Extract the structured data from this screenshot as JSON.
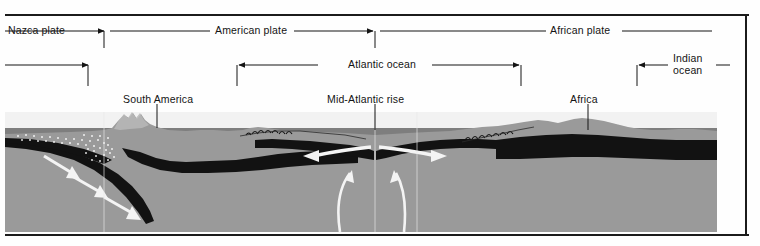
{
  "figure": {
    "colors": {
      "background": "#fefefe",
      "frame": "#1b1b1b",
      "mantle": "#7e7e7e",
      "crust_dark": "#121212",
      "landmass": "#9a9a9a",
      "water_sky": "#f2f2f2",
      "arrow_white": "#f4f4f4",
      "label_text": "#141414"
    }
  },
  "plate_labels": [
    {
      "id": "nazca",
      "label": "Nazca plate",
      "text_x": 8,
      "text_y": 27
    },
    {
      "id": "american",
      "label": "American plate",
      "text_x": 215,
      "text_y": 27
    },
    {
      "id": "african",
      "label": "African plate",
      "text_x": 550,
      "text_y": 27
    }
  ],
  "ocean_labels": [
    {
      "id": "pacific",
      "label": "",
      "text_x": 0,
      "text_y": 63
    },
    {
      "id": "atlantic",
      "label": "Atlantic ocean",
      "text_x": 348,
      "text_y": 63
    },
    {
      "id": "indian",
      "label_line1": "Indian",
      "label_line2": "ocean",
      "text_x": 673,
      "text_y": 58
    }
  ],
  "feature_labels": [
    {
      "id": "south-america",
      "label": "South America",
      "text_x": 123,
      "text_y": 100
    },
    {
      "id": "mid-atlantic-rise",
      "label": "Mid-Atlantic rise",
      "text_x": 327,
      "text_y": 100
    },
    {
      "id": "africa",
      "label": "Africa",
      "text_x": 570,
      "text_y": 100
    }
  ],
  "motion_arrows": [
    {
      "id": "subduction-1",
      "direction": "down-right",
      "meaning": "Nazca plate descending beneath South America"
    },
    {
      "id": "subduction-2",
      "direction": "down-right",
      "meaning": "Nazca plate descending beneath South America"
    },
    {
      "id": "subduction-3",
      "direction": "down-right",
      "meaning": "Nazca plate descending beneath South America"
    },
    {
      "id": "spreading-west",
      "direction": "left",
      "meaning": "Sea-floor spreading westward from Mid-Atlantic rise"
    },
    {
      "id": "spreading-east",
      "direction": "right",
      "meaning": "Sea-floor spreading eastward from Mid-Atlantic rise"
    },
    {
      "id": "upwelling-west",
      "direction": "up",
      "meaning": "Mantle convection rising under the ridge"
    },
    {
      "id": "upwelling-east",
      "direction": "up",
      "meaning": "Mantle convection rising under the ridge"
    }
  ]
}
